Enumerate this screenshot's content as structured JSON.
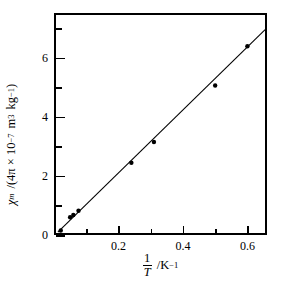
{
  "figure": {
    "background_color": "#ffffff",
    "ink_color": "#000000"
  },
  "chart_data": {
    "type": "scatter",
    "title": "",
    "subtitle": "",
    "xlabel": "1/T  /K⁻¹",
    "ylabel": "χm /(4π × 10⁻⁷ m³ kg⁻¹)",
    "xlabel_parts": {
      "fraction_numerator": "1",
      "fraction_denominator": "T",
      "separator": "/",
      "unit_base": "K",
      "unit_exponent": "−1"
    },
    "ylabel_parts": {
      "symbol": "χ",
      "symbol_subscript": "m",
      "separator": "/",
      "open_paren": "(",
      "factor": "4π × 10",
      "factor_exponent": "−7",
      "unit_length": "m",
      "unit_length_exponent": "3",
      "unit_mass": "kg",
      "unit_mass_exponent": "−1",
      "close_paren": ")"
    },
    "xlim": [
      0.0,
      0.6608
    ],
    "ylim": [
      0.0,
      7.525
    ],
    "xticks_major": [
      0.2,
      0.4,
      0.6
    ],
    "xticks_major_labels": [
      "0.2",
      "0.4",
      "0.6"
    ],
    "xticks_minor": [
      0.1,
      0.3,
      0.5
    ],
    "yticks_major": [
      0,
      2,
      4,
      6
    ],
    "yticks_major_labels": [
      "0",
      "2",
      "4",
      "6"
    ],
    "yticks_minor": [
      1,
      3,
      5,
      7
    ],
    "grid": false,
    "legend": null,
    "legend_position": "none",
    "marker": "filled-circle",
    "marker_color": "#000000",
    "marker_size_px": 4.4,
    "line_color": "#000000",
    "line_width_px": 1.1,
    "series": [
      {
        "name": "magnetic susceptibility vs inverse temperature",
        "points": [
          {
            "x": 0.021,
            "y": 0.15
          },
          {
            "x": 0.05,
            "y": 0.6
          },
          {
            "x": 0.06,
            "y": 0.68
          },
          {
            "x": 0.076,
            "y": 0.82
          },
          {
            "x": 0.24,
            "y": 2.45
          },
          {
            "x": 0.31,
            "y": 3.15
          },
          {
            "x": 0.5,
            "y": 5.07
          },
          {
            "x": 0.6,
            "y": 6.4
          }
        ]
      }
    ],
    "fit_line": {
      "name": "least-squares best fit line",
      "x_start": 0.012,
      "y_start": 0.1,
      "x_end": 0.655,
      "y_end": 6.96
    }
  }
}
